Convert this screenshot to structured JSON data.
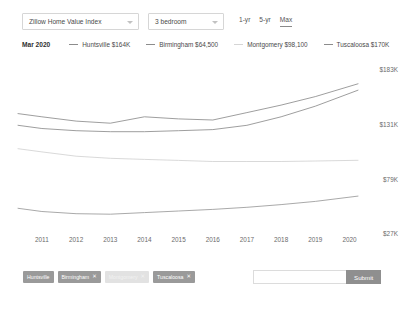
{
  "controls": {
    "metric_select": {
      "value": "Zillow Home Value Index",
      "caret": "chevron-down-icon"
    },
    "bedroom_select": {
      "value": "3 bedroom",
      "caret": "chevron-down-icon"
    },
    "ranges": [
      {
        "label": "1-yr",
        "active": false
      },
      {
        "label": "5-yr",
        "active": false
      },
      {
        "label": "Max",
        "active": true
      }
    ]
  },
  "legend": {
    "date": "Mar 2020",
    "items": [
      {
        "label": "Huntsville $164K",
        "color": "#8c8c8c"
      },
      {
        "label": "Birmingham $64,500",
        "color": "#8c8c8c"
      },
      {
        "label": "Montgomery $98,100",
        "color": "#cfcfcf"
      },
      {
        "label": "Tuscaloosa $170K",
        "color": "#8c8c8c"
      }
    ]
  },
  "search": {
    "placeholder": "",
    "value": "",
    "submit_label": "Submit"
  },
  "chips": [
    {
      "label": "Huntsville",
      "removable": false,
      "ghost": false,
      "remove_icon": ""
    },
    {
      "label": "Birmingham",
      "removable": true,
      "ghost": false,
      "remove_icon": "✕"
    },
    {
      "label": "Montgomery",
      "removable": true,
      "ghost": true,
      "remove_icon": "✕"
    },
    {
      "label": "Tuscaloosa",
      "removable": true,
      "ghost": false,
      "remove_icon": "✕"
    }
  ],
  "chart_data": {
    "type": "line",
    "title": "Zillow Home Value Index",
    "xlabel": "",
    "ylabel": "",
    "grid": false,
    "legend_position": "top",
    "ylim": [
      27000,
      183000
    ],
    "ytick_labels": [
      "$183K",
      "$131K",
      "$79K",
      "$27K"
    ],
    "ytick_values": [
      183000,
      131000,
      79000,
      27000
    ],
    "x": [
      2010.3,
      2011,
      2012,
      2013,
      2014,
      2015,
      2016,
      2017,
      2018,
      2019,
      2020.25
    ],
    "xtick_labels": [
      "2011",
      "2012",
      "2013",
      "2014",
      "2015",
      "2016",
      "2017",
      "2018",
      "2019",
      "2020"
    ],
    "xtick_values": [
      2011,
      2012,
      2013,
      2014,
      2015,
      2016,
      2017,
      2018,
      2019,
      2020
    ],
    "series": [
      {
        "name": "Tuscaloosa",
        "color": "#8c8c8c",
        "end_value": 170000,
        "values": [
          142000,
          139000,
          135000,
          133000,
          139000,
          137000,
          136000,
          143000,
          150000,
          158000,
          170000
        ]
      },
      {
        "name": "Huntsville",
        "color": "#8c8c8c",
        "end_value": 164000,
        "values": [
          131000,
          128000,
          126000,
          125000,
          125000,
          126000,
          127000,
          131000,
          139000,
          149000,
          164000
        ]
      },
      {
        "name": "Montgomery",
        "color": "#d2d2d2",
        "end_value": 98100,
        "values": [
          109000,
          106000,
          102000,
          100000,
          99000,
          98000,
          97000,
          97000,
          97000,
          97500,
          98100
        ]
      },
      {
        "name": "Birmingham",
        "color": "#9a9a9a",
        "end_value": 64500,
        "values": [
          53000,
          50000,
          48000,
          47500,
          49000,
          50500,
          52000,
          54000,
          56500,
          59500,
          64500
        ]
      }
    ]
  }
}
